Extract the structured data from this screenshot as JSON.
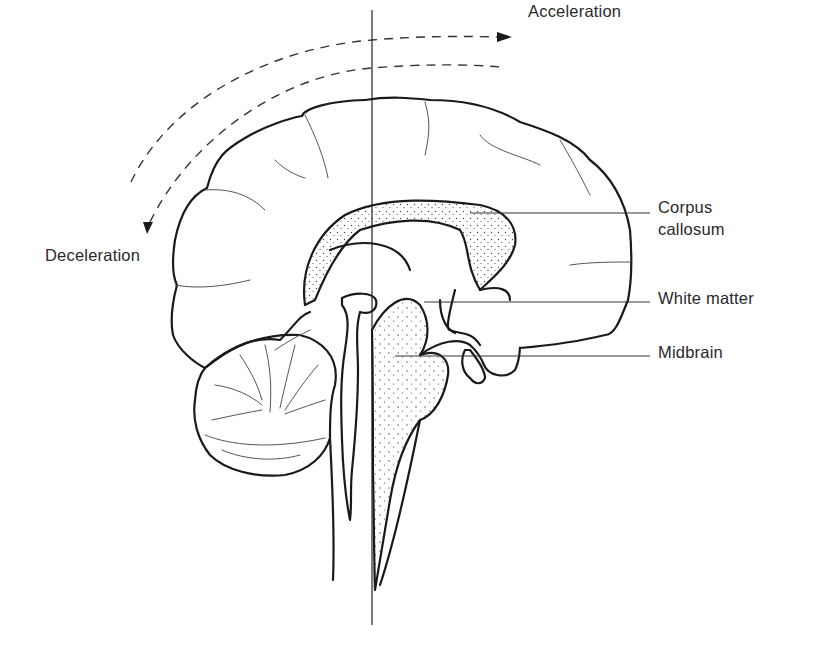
{
  "figure": {
    "type": "anatomical diagram",
    "labels": {
      "acceleration": "Acceleration",
      "deceleration": "Deceleration",
      "corpus_callosum_line1": "Corpus",
      "corpus_callosum_line2": "callosum",
      "white_matter": "White matter",
      "midbrain": "Midbrain"
    },
    "arrows": [
      {
        "name": "acceleration-arrow",
        "style": "dashed",
        "direction": "right"
      },
      {
        "name": "deceleration-arrow",
        "style": "dashed",
        "direction": "down-left"
      }
    ],
    "colors": {
      "line": "#1a1a1a",
      "text": "#2a2a2a",
      "stipple": "#444444",
      "background": "#ffffff"
    }
  }
}
